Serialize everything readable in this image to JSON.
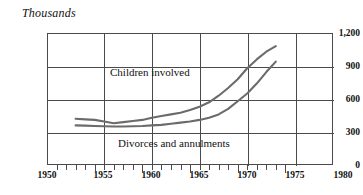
{
  "chart_data": {
    "type": "line",
    "title": "",
    "unit_label": "Thousands",
    "xlabel": "",
    "ylabel": "Thousands",
    "xlim": [
      1950,
      1980
    ],
    "ylim": [
      0,
      1200
    ],
    "xticks": [
      1950,
      1955,
      1960,
      1965,
      1970,
      1975,
      1980
    ],
    "yticks": [
      0,
      300,
      600,
      900,
      1200
    ],
    "ytick_labels": [
      "0",
      "300",
      "600",
      "900",
      "1,200"
    ],
    "xtick_labels": [
      "1950",
      "1955",
      "1960",
      "1965",
      "1970",
      "1975",
      "1980"
    ],
    "minor_tick_interval": 1,
    "minor_tick_range": [
      1951,
      1975
    ],
    "grid": "major-xy",
    "legend": "inline-annotations",
    "line_color": "#6b6b6b",
    "frame_color": "#4a4a4a",
    "series": [
      {
        "name": "Children involved",
        "label_x": 1960,
        "x": [
          1953,
          1954,
          1955,
          1956,
          1957,
          1958,
          1959,
          1960,
          1961,
          1962,
          1963,
          1964,
          1965,
          1966,
          1967,
          1968,
          1969,
          1970,
          1971,
          1972,
          1973,
          1974
        ],
        "values": [
          420,
          415,
          410,
          395,
          380,
          390,
          400,
          410,
          430,
          445,
          460,
          475,
          500,
          530,
          570,
          630,
          700,
          780,
          880,
          960,
          1030,
          1080
        ]
      },
      {
        "name": "Divorces and annulments",
        "label_x": 1963,
        "x": [
          1953,
          1954,
          1955,
          1956,
          1957,
          1958,
          1959,
          1960,
          1961,
          1962,
          1963,
          1964,
          1965,
          1966,
          1967,
          1968,
          1969,
          1970,
          1971,
          1972,
          1973,
          1974
        ],
        "values": [
          360,
          358,
          355,
          352,
          350,
          350,
          352,
          355,
          360,
          365,
          375,
          385,
          395,
          410,
          430,
          460,
          510,
          580,
          650,
          740,
          845,
          940
        ]
      }
    ]
  },
  "labels": {
    "unit": "Thousands",
    "children": "Children involved",
    "divorces": "Divorces and annulments"
  }
}
